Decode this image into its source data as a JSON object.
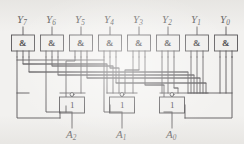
{
  "figure": {
    "kind": "logic-circuit-schematic",
    "background_color": "#f2f1ef",
    "ink_color": "#4a484b",
    "wire_color": "#555356"
  },
  "inputs": {
    "label_base": "Y",
    "items": [
      {
        "id": "y7",
        "base": "Y",
        "sub": "7",
        "text": "Y7",
        "x": 23
      },
      {
        "id": "y6",
        "base": "Y",
        "sub": "6",
        "text": "Y6",
        "x": 52
      },
      {
        "id": "y5",
        "base": "Y",
        "sub": "5",
        "text": "Y5",
        "x": 81
      },
      {
        "id": "y4",
        "base": "Y",
        "sub": "4",
        "text": "Y4",
        "x": 110
      },
      {
        "id": "y3",
        "base": "Y",
        "sub": "3",
        "text": "Y3",
        "x": 139
      },
      {
        "id": "y2",
        "base": "Y",
        "sub": "2",
        "text": "Y2",
        "x": 168
      },
      {
        "id": "y1",
        "base": "Y",
        "sub": "1",
        "text": "Y1",
        "x": 197
      },
      {
        "id": "y0",
        "base": "Y",
        "sub": "0",
        "text": "Y0",
        "x": 226
      }
    ]
  },
  "and_gates": {
    "symbol": "&",
    "count": 8,
    "box": {
      "w": 23,
      "h": 16,
      "y": 35
    },
    "items": [
      {
        "id": "and-y7",
        "symbol": "&",
        "cx": 23
      },
      {
        "id": "and-y6",
        "symbol": "&",
        "cx": 52
      },
      {
        "id": "and-y5",
        "symbol": "&",
        "cx": 81
      },
      {
        "id": "and-y4",
        "symbol": "&",
        "cx": 110
      },
      {
        "id": "and-y3",
        "symbol": "&",
        "cx": 139
      },
      {
        "id": "and-y2",
        "symbol": "&",
        "cx": 168
      },
      {
        "id": "and-y1",
        "symbol": "&",
        "cx": 197
      },
      {
        "id": "and-y0",
        "symbol": "&",
        "cx": 226
      }
    ]
  },
  "inverters": {
    "symbol": "1",
    "count": 3,
    "box": {
      "w": 25,
      "h": 16,
      "y": 97
    },
    "items": [
      {
        "id": "inv-a2",
        "symbol": "1",
        "cx": 72,
        "bubble": true
      },
      {
        "id": "inv-a1",
        "symbol": "1",
        "cx": 122,
        "bubble": true
      },
      {
        "id": "inv-a0",
        "symbol": "1",
        "cx": 172,
        "bubble": true
      }
    ]
  },
  "outputs": {
    "label_base": "A",
    "items": [
      {
        "id": "a2",
        "base": "A",
        "sub": "2",
        "text": "A2",
        "x": 72
      },
      {
        "id": "a1",
        "base": "A",
        "sub": "1",
        "text": "A1",
        "x": 122
      },
      {
        "id": "a0",
        "base": "A",
        "sub": "0",
        "text": "A0",
        "x": 172
      }
    ]
  },
  "bus": {
    "rows": [
      {
        "id": "bus-row-1",
        "y": 57
      },
      {
        "id": "bus-row-2",
        "y": 63
      },
      {
        "id": "bus-row-3",
        "y": 69
      },
      {
        "id": "bus-row-4",
        "y": 75
      },
      {
        "id": "bus-row-5",
        "y": 81
      },
      {
        "id": "bus-row-6",
        "y": 87
      }
    ]
  }
}
